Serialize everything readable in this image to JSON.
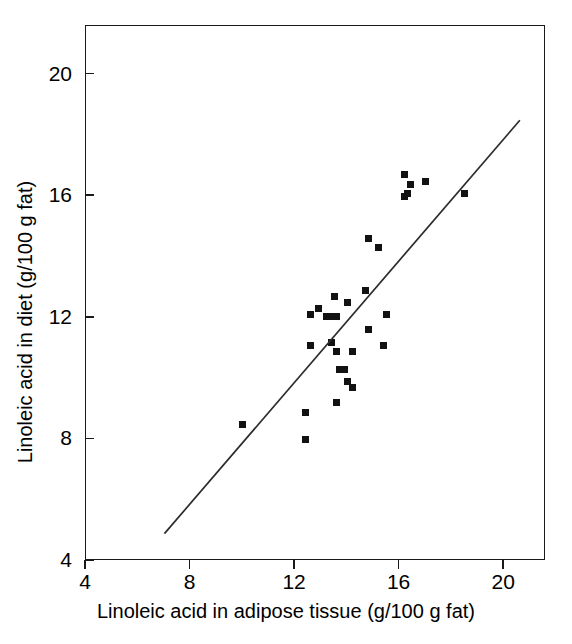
{
  "chart_data": {
    "type": "scatter",
    "title": "",
    "xlabel": "Linoleic acid in adipose tissue (g/100 g fat)",
    "ylabel": "Linoleic acid in diet (g/100 g fat)",
    "xlim": [
      4,
      21.6
    ],
    "ylim": [
      4,
      21.6
    ],
    "xticks": [
      4,
      8,
      12,
      16,
      20
    ],
    "yticks": [
      4,
      8,
      12,
      16,
      20
    ],
    "xtick_labels": [
      "4",
      "8",
      "12",
      "16",
      "20"
    ],
    "ytick_labels": [
      "4",
      "8",
      "12",
      "16",
      "20"
    ],
    "grid": false,
    "legend": null,
    "marker": "square",
    "marker_color": "#121212",
    "axis_color": "#1a1a1a",
    "series": [
      {
        "name": "Subjects",
        "points": [
          [
            16.2,
            16.7
          ],
          [
            16.4,
            16.4
          ],
          [
            16.2,
            16.0
          ],
          [
            16.3,
            16.1
          ],
          [
            17.0,
            16.5
          ],
          [
            18.5,
            16.1
          ],
          [
            14.8,
            14.6
          ],
          [
            15.2,
            14.3
          ],
          [
            14.7,
            12.9
          ],
          [
            13.5,
            12.7
          ],
          [
            14.0,
            12.5
          ],
          [
            12.9,
            12.3
          ],
          [
            12.6,
            12.1
          ],
          [
            13.2,
            12.05
          ],
          [
            13.4,
            12.05
          ],
          [
            13.6,
            12.05
          ],
          [
            15.5,
            12.1
          ],
          [
            14.8,
            11.6
          ],
          [
            13.4,
            11.2
          ],
          [
            12.6,
            11.1
          ],
          [
            15.4,
            11.1
          ],
          [
            13.6,
            10.9
          ],
          [
            14.2,
            10.9
          ],
          [
            13.7,
            10.3
          ],
          [
            13.9,
            10.3
          ],
          [
            14.0,
            9.9
          ],
          [
            14.2,
            9.7
          ],
          [
            13.6,
            9.2
          ],
          [
            12.4,
            8.9
          ],
          [
            10.0,
            8.5
          ],
          [
            12.4,
            8.0
          ]
        ]
      }
    ],
    "fit_line": {
      "name": "regression line",
      "x0": 7.0,
      "y0": 4.9,
      "x1": 20.6,
      "y1": 18.5,
      "color": "#2b2b2b"
    }
  },
  "axes": {
    "x_tick_labels": [
      "4",
      "8",
      "12",
      "16",
      "20"
    ],
    "y_tick_labels": [
      "4",
      "8",
      "12",
      "16",
      "20"
    ],
    "x_title": "Linoleic acid in adipose tissue (g/100 g fat)",
    "y_title": "Linoleic acid in diet (g/100 g fat)"
  }
}
